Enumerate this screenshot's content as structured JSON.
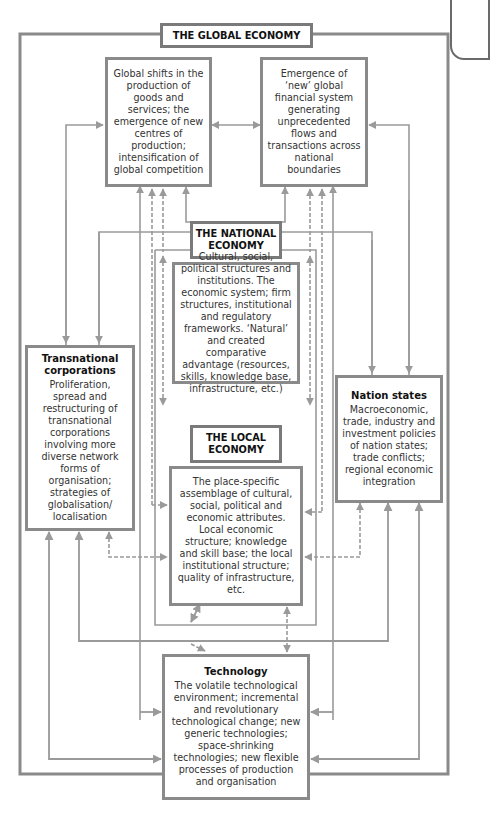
{
  "diagram": {
    "global_economy": {
      "title": "THE GLOBAL ECONOMY",
      "production_box": "Global shifts in the production of goods and services; the emergence of new centres of production; intensification of global competition",
      "financial_box": "Emergence of ‘new’ global financial system generating unprecedented flows and transactions across national boundaries"
    },
    "national_economy": {
      "title": "THE NATIONAL ECONOMY",
      "body": "Cultural, social, political structures and institutions. The economic system; firm structures, institutional and regulatory frameworks. ‘Natural’ and created comparative advantage (resources, skills, knowledge base, infrastructure, etc.)"
    },
    "local_economy": {
      "title": "THE LOCAL ECONOMY",
      "body": "The place-specific assemblage of cultural, social, political and economic attributes. Local economic structure; knowledge and skill base; the local institutional structure; quality of infrastructure, etc."
    },
    "transnational": {
      "heading": "Transnational corporations",
      "body": "Proliferation, spread and restructuring of transnational corporations involving more diverse network forms of organisation; strategies of globalisation/ localisation"
    },
    "nation_states": {
      "heading": "Nation states",
      "body": "Macroeconomic, trade, industry and investment policies of nation states; trade conflicts; regional economic integration"
    },
    "technology": {
      "heading": "Technology",
      "body": "The volatile technological environment; incremental and revolutionary technological change; new generic technologies; space-shrinking technologies; new flexible processes of production and organisation"
    },
    "colors": {
      "box_border": "#8a8a8a",
      "line": "#9a9a9a",
      "frame": "#8a8a8a"
    }
  }
}
